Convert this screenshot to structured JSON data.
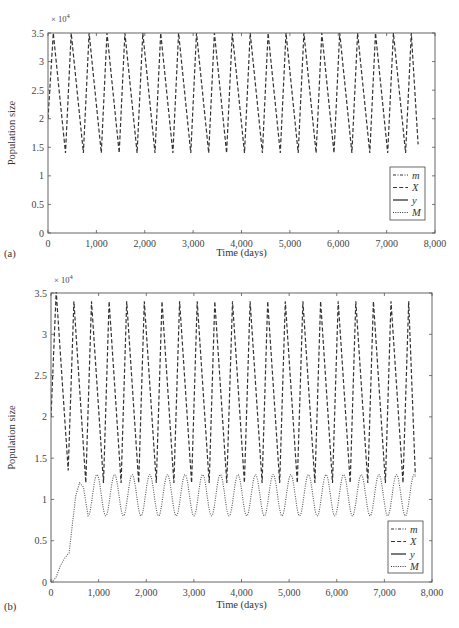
{
  "chart_data": [
    {
      "panel": "(a)",
      "type": "line",
      "title": "",
      "xlabel": "Time (days)",
      "ylabel": "Population size",
      "y_multiplier": "× 10^4",
      "xlim": [
        0,
        8000
      ],
      "ylim": [
        0,
        3.5
      ],
      "x_ticks": [
        "0",
        "1,000",
        "2,000",
        "3,000",
        "4,000",
        "5,000",
        "6,000",
        "7,000",
        "8,000"
      ],
      "y_ticks": [
        "0",
        "0.5",
        "1",
        "1.5",
        "2",
        "2.5",
        "3",
        "3.5"
      ],
      "grid": false,
      "legend_position": "lower right",
      "legend": [
        {
          "label": "m",
          "style": "dash-dot"
        },
        {
          "label": "X",
          "style": "dashed"
        },
        {
          "label": "y",
          "style": "solid"
        },
        {
          "label": "M",
          "style": "dotted"
        }
      ],
      "series": [
        {
          "name": "X",
          "style": "dashed",
          "description": "sawtooth oscillation between ~1.4 and 3.5 (×10^4), period ~370 days, starting at 2.0, ending ~t=7650 at ~1.55",
          "start_value": 2.0,
          "peak_value": 3.5,
          "trough_value": 1.4,
          "period_days": 370,
          "end_time": 7650,
          "end_value": 1.55
        }
      ]
    },
    {
      "panel": "(b)",
      "type": "line",
      "title": "",
      "xlabel": "Time (days)",
      "ylabel": "Population size",
      "y_multiplier": "× 10^4",
      "xlim": [
        0,
        8000
      ],
      "ylim": [
        0,
        3.5
      ],
      "x_ticks": [
        "0",
        "1,000",
        "2,000",
        "3,000",
        "4,000",
        "5,000",
        "6,000",
        "7,000",
        "8,000"
      ],
      "y_ticks": [
        "0",
        "0.5",
        "1",
        "1.5",
        "2",
        "2.5",
        "3",
        "3.5"
      ],
      "grid": false,
      "legend_position": "lower right",
      "legend": [
        {
          "label": "m",
          "style": "dash-dot"
        },
        {
          "label": "X",
          "style": "dashed"
        },
        {
          "label": "y",
          "style": "solid"
        },
        {
          "label": "M",
          "style": "dotted"
        }
      ],
      "series": [
        {
          "name": "X",
          "style": "dashed",
          "description": "oscillation; first peak ~3.5, later peaks ~3.4; first trough ~1.35, later troughs ~1.2; period ~370 days; starts at 2.0",
          "start_value": 2.0,
          "peak_value": 3.4,
          "trough_value": 1.2,
          "period_days": 370,
          "end_time": 7650
        },
        {
          "name": "M",
          "style": "dotted",
          "description": "rises from 0 to ~1.2 by t≈600, then oscillates between ~0.8 and ~1.3 with period ~370 days",
          "points": [
            [
              0,
              0
            ],
            [
              100,
              0.05
            ],
            [
              200,
              0.2
            ],
            [
              300,
              0.3
            ],
            [
              380,
              0.35
            ],
            [
              450,
              0.7
            ],
            [
              520,
              1.05
            ],
            [
              600,
              1.2
            ],
            [
              680,
              1.15
            ],
            [
              780,
              0.8
            ]
          ],
          "peak_value": 1.3,
          "trough_value": 0.8,
          "period_days": 370,
          "end_time": 7650,
          "end_value": 1.05
        }
      ]
    }
  ]
}
